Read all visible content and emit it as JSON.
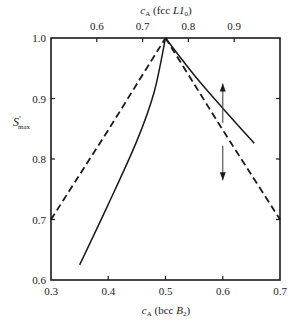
{
  "chart_data": {
    "type": "line",
    "title": "",
    "xlabel": "c_A (bcc B2)",
    "xlabel_parts": {
      "var": "c",
      "sub": "A",
      "rest": " (bcc ",
      "phase": "B",
      "phase_sub": "2",
      "close": ")"
    },
    "x2label": "c_A (fcc L1_0)",
    "x2label_parts": {
      "var": "c",
      "sub": "A",
      "rest": " (fcc ",
      "phase": "L1",
      "phase_sub": "0",
      "close": ")"
    },
    "ylabel": "S'_max",
    "ylabel_parts": {
      "var": "S",
      "prime": "′",
      "sub": "max"
    },
    "xlim": [
      0.3,
      0.7
    ],
    "ylim": [
      0.6,
      1.0
    ],
    "x2lim": [
      0.5,
      1.0
    ],
    "x_ticks": [
      0.3,
      0.4,
      0.5,
      0.6,
      0.7
    ],
    "x_tick_labels": [
      "0.3",
      "0.4",
      "0.5",
      "0.6",
      "0.7"
    ],
    "x2_ticks": [
      0.6,
      0.7,
      0.8,
      0.9
    ],
    "x2_tick_labels": [
      "0.6",
      "0.7",
      "0.8",
      "0.9"
    ],
    "y_ticks": [
      0.6,
      0.7,
      0.8,
      0.9,
      1.0
    ],
    "y_tick_labels": [
      "0.6",
      "0.7",
      "0.8",
      "0.9",
      "1.0"
    ],
    "grid": false,
    "legend": null,
    "series": [
      {
        "name": "bcc B2 (dashed, left branch)",
        "style": "dashed",
        "axis": "bottom",
        "x": [
          0.3,
          0.35,
          0.4,
          0.45,
          0.5
        ],
        "y": [
          0.7,
          0.774,
          0.848,
          0.924,
          1.0
        ]
      },
      {
        "name": "bcc B2 (dashed, right branch)",
        "style": "dashed",
        "axis": "bottom",
        "x": [
          0.5,
          0.55,
          0.6,
          0.65,
          0.7
        ],
        "y": [
          1.0,
          0.924,
          0.848,
          0.774,
          0.7
        ]
      },
      {
        "name": "fcc L1_0 (solid, left branch)",
        "style": "solid",
        "axis": "bottom",
        "x": [
          0.35,
          0.4,
          0.45,
          0.48,
          0.5
        ],
        "y": [
          0.625,
          0.725,
          0.83,
          0.91,
          1.0
        ]
      },
      {
        "name": "fcc L1_0 (solid, right branch)",
        "style": "solid",
        "axis": "bottom",
        "x": [
          0.5,
          0.55,
          0.6,
          0.655
        ],
        "y": [
          1.0,
          0.939,
          0.884,
          0.826
        ]
      }
    ],
    "annotations": [
      {
        "type": "arrow",
        "direction": "up",
        "x": 0.6,
        "y_from": 0.86,
        "y_to": 0.925
      },
      {
        "type": "arrow",
        "direction": "down",
        "x": 0.6,
        "y_from": 0.822,
        "y_to": 0.765
      }
    ]
  }
}
